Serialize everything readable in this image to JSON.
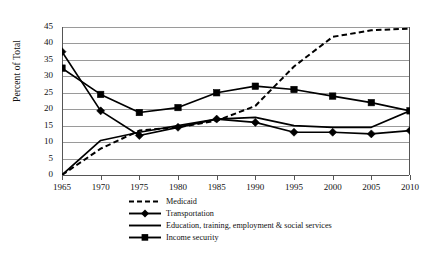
{
  "chart_data": {
    "type": "line",
    "title": "",
    "xlabel": "",
    "ylabel": "Percent of Total",
    "x": [
      1965,
      1970,
      1975,
      1980,
      1985,
      1990,
      1995,
      2000,
      2005,
      2010
    ],
    "xticklabels": [
      "1965",
      "1970",
      "1975",
      "1980",
      "1985",
      "1990",
      "1995",
      "2000",
      "2005",
      "2010"
    ],
    "yticklabels": [
      "0",
      "5",
      "10",
      "15",
      "20",
      "25",
      "30",
      "35",
      "40",
      "45"
    ],
    "ylim": [
      0,
      45
    ],
    "ytick_step": 5,
    "xlim": [
      1965,
      2010
    ],
    "grid": "horizontal",
    "legend_position": "below-center",
    "series": [
      {
        "name": "Medicaid",
        "style": "dashed",
        "marker": "none",
        "color": "#000000",
        "values": [
          0,
          8.0,
          13.5,
          14.5,
          16.5,
          21.0,
          33.0,
          42.0,
          44.0,
          44.5
        ]
      },
      {
        "name": "Transportation",
        "style": "solid",
        "marker": "diamond",
        "color": "#000000",
        "values": [
          37.5,
          19.5,
          12.0,
          14.5,
          17.0,
          16.0,
          13.0,
          13.0,
          12.5,
          13.5
        ]
      },
      {
        "name": "Education, training, employment & social services",
        "style": "solid",
        "marker": "none",
        "color": "#000000",
        "values": [
          0.0,
          10.5,
          13.0,
          15.0,
          17.0,
          17.5,
          15.0,
          14.5,
          14.5,
          19.5
        ]
      },
      {
        "name": "Income security",
        "style": "solid",
        "marker": "square",
        "color": "#000000",
        "values": [
          32.5,
          24.5,
          19.0,
          20.5,
          25.0,
          27.0,
          26.0,
          24.0,
          22.0,
          19.5
        ]
      }
    ]
  },
  "legend": {
    "items": [
      {
        "label": "Medicaid",
        "key": "dashed-line-key"
      },
      {
        "label": "Transportation",
        "key": "diamond-marker-key"
      },
      {
        "label": "Education, training, employment & social services",
        "key": "plain-line-key"
      },
      {
        "label": "Income security",
        "key": "square-marker-key"
      }
    ]
  },
  "colors": {
    "ink": "#000000",
    "gridline": "#9a9a9a",
    "axis": "#555555",
    "background": "#ffffff"
  }
}
